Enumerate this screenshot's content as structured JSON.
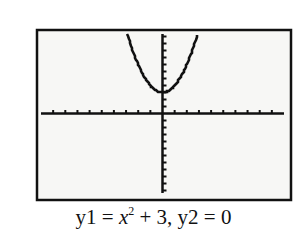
{
  "chart_data": {
    "type": "line",
    "title": "",
    "caption": "y1 = x^2 + 3, y2 = 0",
    "series": [
      {
        "name": "y1",
        "expression": "x^2 + 3",
        "x": [
          -2.9,
          -2.5,
          -2,
          -1.5,
          -1,
          -0.5,
          0,
          0.5,
          1,
          1.5,
          2,
          2.5,
          2.9
        ],
        "values": [
          11.41,
          9.25,
          7,
          5.25,
          4,
          3.25,
          3,
          3.25,
          4,
          5.25,
          7,
          9.25,
          11.41
        ]
      },
      {
        "name": "y2",
        "expression": "0",
        "x": [
          -10,
          10
        ],
        "values": [
          0,
          0
        ]
      }
    ],
    "xlabel": "",
    "ylabel": "",
    "xlim": [
      -10,
      10
    ],
    "ylim": [
      -11.5,
      11.5
    ],
    "xscl": 1,
    "yscl": 1,
    "grid": false,
    "legend": "none"
  },
  "caption": {
    "lhs1": "y1 = ",
    "var": "x",
    "exp": "2",
    "rest": " + 3, y2 = 0"
  },
  "colors": {
    "ink": "#111111",
    "screen": "#f7f7f5",
    "background": "#ffffff"
  }
}
